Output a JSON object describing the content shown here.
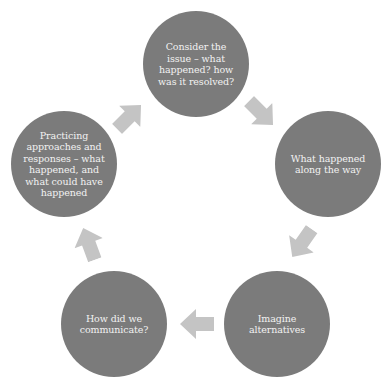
{
  "diagram": {
    "type": "cycle",
    "colors": {
      "background": "#ffffff",
      "node_fill": "#7b7b7b",
      "node_text": "#f2f2f2",
      "arrow_fill": "#c4c4c4"
    },
    "nodes": [
      {
        "id": "consider-issue",
        "label": "Consider the issue – what happened? how was it resolved?"
      },
      {
        "id": "along-the-way",
        "label": "What happened along the way"
      },
      {
        "id": "imagine-alternatives",
        "label": "Imagine alternatives"
      },
      {
        "id": "communicate",
        "label": "How did we communicate?"
      },
      {
        "id": "practicing",
        "label": "Practicing approaches and responses – what happened, and what could have happened"
      }
    ],
    "arrows": [
      {
        "from": "consider-issue",
        "to": "along-the-way",
        "icon": "arrow-right-down-icon"
      },
      {
        "from": "along-the-way",
        "to": "imagine-alternatives",
        "icon": "arrow-down-left-icon"
      },
      {
        "from": "imagine-alternatives",
        "to": "communicate",
        "icon": "arrow-left-icon"
      },
      {
        "from": "communicate",
        "to": "practicing",
        "icon": "arrow-up-icon"
      },
      {
        "from": "practicing",
        "to": "consider-issue",
        "icon": "arrow-up-right-icon"
      }
    ]
  }
}
